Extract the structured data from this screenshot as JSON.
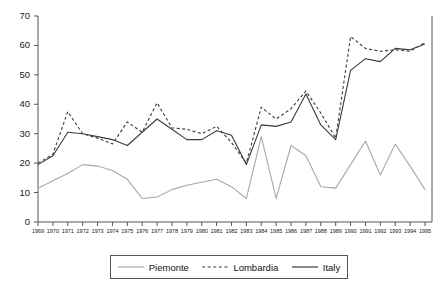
{
  "chart_data": {
    "type": "line",
    "title": "",
    "xlabel": "",
    "ylabel": "",
    "ylim": [
      0,
      70
    ],
    "yticks": [
      0,
      10,
      20,
      30,
      40,
      50,
      60,
      70
    ],
    "grid": false,
    "legend_position": "bottom",
    "x": [
      1969,
      1970,
      1971,
      1972,
      1973,
      1974,
      1975,
      1976,
      1977,
      1978,
      1979,
      1980,
      1981,
      1982,
      1983,
      1984,
      1985,
      1986,
      1987,
      1988,
      1989,
      1990,
      1991,
      1992,
      1993,
      1994,
      1995
    ],
    "categories": [
      "1969",
      "1970",
      "1971",
      "1972",
      "1973",
      "1974",
      "1975",
      "1976",
      "1977",
      "1978",
      "1979",
      "1980",
      "1981",
      "1982",
      "1983",
      "1984",
      "1985",
      "1986",
      "1987",
      "1988",
      "1989",
      "1990",
      "1991",
      "1992",
      "1993",
      "1994",
      "1995"
    ],
    "series": [
      {
        "name": "Piemonte",
        "style": "solid",
        "color": "#a8a8a8",
        "values": [
          11.5,
          14.0,
          16.5,
          19.5,
          19.0,
          17.5,
          14.5,
          8.0,
          8.5,
          11.0,
          12.5,
          13.5,
          14.5,
          12.0,
          8.0,
          29.0,
          8.0,
          26.0,
          22.5,
          12.0,
          11.5,
          19.5,
          27.5,
          16.0,
          26.5,
          19.0,
          11.0
        ]
      },
      {
        "name": "Lombardia",
        "style": "dashed",
        "color": "#3a3a3a",
        "values": [
          20.0,
          23.0,
          37.5,
          30.0,
          28.5,
          26.5,
          34.0,
          30.5,
          40.5,
          32.0,
          31.5,
          30.0,
          32.5,
          27.0,
          20.0,
          39.0,
          35.0,
          38.5,
          44.5,
          37.0,
          28.5,
          63.0,
          59.0,
          58.0,
          58.5,
          58.0,
          61.0
        ]
      },
      {
        "name": "Italy",
        "style": "solid",
        "color": "#3a3a3a",
        "values": [
          19.5,
          22.5,
          30.5,
          30.0,
          29.0,
          28.0,
          26.0,
          30.5,
          35.0,
          31.5,
          28.0,
          28.0,
          31.0,
          29.5,
          19.5,
          33.0,
          32.5,
          34.0,
          43.5,
          33.0,
          28.0,
          51.5,
          55.5,
          54.5,
          59.0,
          58.5,
          60.5
        ]
      }
    ]
  },
  "legend": {
    "items": [
      {
        "label": "Piemonte"
      },
      {
        "label": "Lombardia"
      },
      {
        "label": "Italy"
      }
    ]
  }
}
